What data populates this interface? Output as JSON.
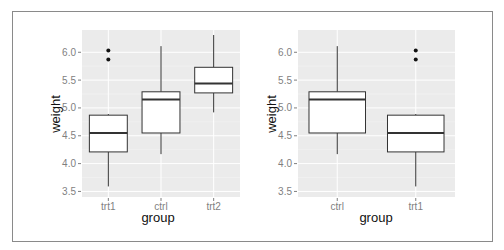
{
  "chart_data": [
    {
      "type": "box",
      "title": "",
      "xlabel": "group",
      "ylabel": "weight",
      "ylim": [
        3.4,
        6.4
      ],
      "yticks": [
        "3.5",
        "4.0",
        "4.5",
        "5.0",
        "5.5",
        "6.0"
      ],
      "ytick_values": [
        3.5,
        4.0,
        4.5,
        5.0,
        5.5,
        6.0
      ],
      "grid": true,
      "categories": [
        "trt1",
        "ctrl",
        "trt2"
      ],
      "boxes": [
        {
          "category": "trt1",
          "lower_whisker": 3.59,
          "q1": 4.21,
          "median": 4.55,
          "q3": 4.87,
          "upper_whisker": 4.89,
          "outliers": [
            6.03,
            5.87
          ]
        },
        {
          "category": "ctrl",
          "lower_whisker": 4.17,
          "q1": 4.55,
          "median": 5.15,
          "q3": 5.29,
          "upper_whisker": 6.11,
          "outliers": []
        },
        {
          "category": "trt2",
          "lower_whisker": 4.92,
          "q1": 5.27,
          "median": 5.44,
          "q3": 5.73,
          "upper_whisker": 6.31,
          "outliers": []
        }
      ]
    },
    {
      "type": "box",
      "title": "",
      "xlabel": "group",
      "ylabel": "weight",
      "ylim": [
        3.4,
        6.4
      ],
      "yticks": [
        "3.5",
        "4.0",
        "4.5",
        "5.0",
        "5.5",
        "6.0"
      ],
      "ytick_values": [
        3.5,
        4.0,
        4.5,
        5.0,
        5.5,
        6.0
      ],
      "grid": true,
      "categories": [
        "ctrl",
        "trt1"
      ],
      "boxes": [
        {
          "category": "ctrl",
          "lower_whisker": 4.17,
          "q1": 4.55,
          "median": 5.15,
          "q3": 5.29,
          "upper_whisker": 6.11,
          "outliers": []
        },
        {
          "category": "trt1",
          "lower_whisker": 3.59,
          "q1": 4.21,
          "median": 4.55,
          "q3": 4.87,
          "upper_whisker": 4.89,
          "outliers": [
            6.03,
            5.87
          ]
        }
      ]
    }
  ],
  "panels": [
    {
      "xlabel": "group",
      "ylabel": "weight"
    },
    {
      "xlabel": "group",
      "ylabel": "weight"
    }
  ],
  "colors": {
    "panel_bg": "#ebebeb",
    "grid": "#ffffff",
    "box_fill": "#ffffff",
    "box_line": "#333333",
    "tick_text": "#7f7f7f",
    "frame": "#8a8a8a"
  }
}
